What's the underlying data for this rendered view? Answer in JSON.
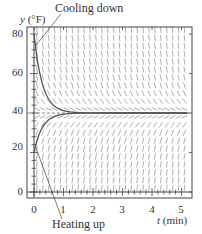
{
  "chart_data": {
    "type": "line",
    "title": "",
    "subtitle": "Slope field for Newton's law of cooling with solution curves",
    "xlabel_var": "t",
    "xlabel_unit": "(min)",
    "ylabel_var": "y",
    "ylabel_unit": "(°F)",
    "xlim": [
      -0.25,
      5.3
    ],
    "ylim": [
      -3,
      84
    ],
    "xticks": [
      0,
      1,
      2,
      3,
      4,
      5
    ],
    "yticks": [
      0,
      20,
      40,
      60,
      80
    ],
    "grid": false,
    "equilibrium": {
      "y": 40,
      "style": "dashed"
    },
    "slope_field": {
      "equation": "dy/dt = -k(y - 40)",
      "k": 3.5
    },
    "series": [
      {
        "name": "Cooling down",
        "x": [
          0,
          0.1,
          0.2,
          0.3,
          0.4,
          0.5,
          0.75,
          1.0,
          1.5,
          2.0,
          3.0,
          4.0,
          5.0
        ],
        "values": [
          80,
          68.2,
          59.9,
          54.0,
          49.9,
          46.9,
          42.9,
          41.2,
          40.2,
          40.0,
          40.0,
          40.0,
          40.0
        ]
      },
      {
        "name": "Heating up",
        "x": [
          0,
          0.1,
          0.2,
          0.3,
          0.4,
          0.5,
          0.75,
          1.0,
          1.5,
          2.0,
          3.0,
          4.0,
          5.0
        ],
        "values": [
          20,
          25.9,
          30.1,
          33.0,
          35.1,
          36.5,
          38.6,
          39.4,
          39.9,
          40.0,
          40.0,
          40.0,
          40.0
        ]
      }
    ],
    "annotations": [
      {
        "text": "Cooling down",
        "points_to": {
          "t": 0.05,
          "y": 74
        }
      },
      {
        "text": "Heating up",
        "points_to": {
          "t": 0.05,
          "y": 23
        }
      }
    ]
  },
  "labels": {
    "y_axis_var": "y",
    "y_axis_unit": " (°F)",
    "x_axis_var": "t",
    "x_axis_unit": " (min)",
    "cooling": "Cooling down",
    "heating": "Heating up",
    "yticks": [
      "80",
      "60",
      "40",
      "20",
      "0"
    ],
    "xticks": [
      "0",
      "1",
      "2",
      "3",
      "4",
      "5"
    ]
  },
  "colors": {
    "axis": "#444444",
    "curve": "#555555",
    "slope": "#9a9a9a",
    "dashed": "#666666"
  }
}
